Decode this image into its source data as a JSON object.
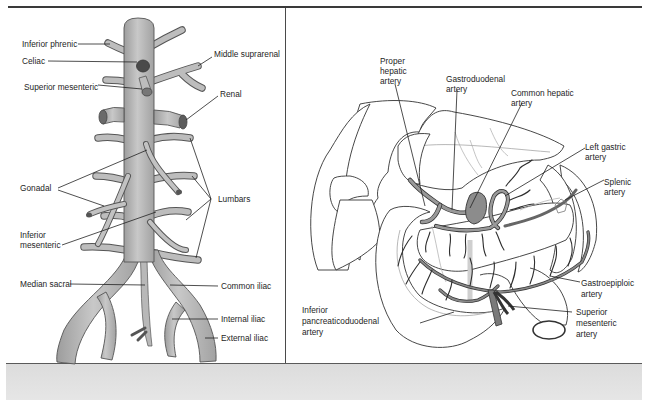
{
  "figure": {
    "left_panel": {
      "title": "Branches of the abdominal aorta",
      "labels": [
        {
          "id": "inferior-phrenic",
          "text": "Inferior phrenic"
        },
        {
          "id": "celiac",
          "text": "Celiac"
        },
        {
          "id": "superior-mesenteric",
          "text": "Superior mesenteric"
        },
        {
          "id": "middle-suprarenal",
          "text": "Middle suprarenal"
        },
        {
          "id": "renal",
          "text": "Renal"
        },
        {
          "id": "gonadal",
          "text": "Gonadal"
        },
        {
          "id": "lumbars",
          "text": "Lumbars"
        },
        {
          "id": "inferior-mesenteric-1",
          "text": "Inferior"
        },
        {
          "id": "inferior-mesenteric-2",
          "text": "mesenteric"
        },
        {
          "id": "median-sacral",
          "text": "Median sacral"
        },
        {
          "id": "common-iliac",
          "text": "Common iliac"
        },
        {
          "id": "internal-iliac",
          "text": "Internal iliac"
        },
        {
          "id": "external-iliac",
          "text": "External iliac"
        }
      ]
    },
    "right_panel": {
      "title": "Celiac trunk and mesenteric branches",
      "labels": {
        "proper_hepatic": [
          "Proper",
          "hepatic",
          "artery"
        ],
        "gastroduodenal": [
          "Gastroduodenal",
          "artery"
        ],
        "common_hepatic": [
          "Common hepatic",
          "artery"
        ],
        "left_gastric": [
          "Left gastric",
          "artery"
        ],
        "splenic": [
          "Splenic",
          "artery"
        ],
        "gastroepiploic": [
          "Gastroepiploic",
          "artery"
        ],
        "superior_mesenteric": [
          "Superior",
          "mesenteric",
          "artery"
        ],
        "inferior_pancreaticoduodenal": [
          "Inferior",
          "pancreaticoduodenal",
          "artery"
        ]
      }
    },
    "colors": {
      "vessel_fill": "#b3b3b3",
      "vessel_stroke": "#555555",
      "artery_dark": "#2e2e2e",
      "rule": "#3a3a3a",
      "band": "#e0e0e0"
    }
  }
}
